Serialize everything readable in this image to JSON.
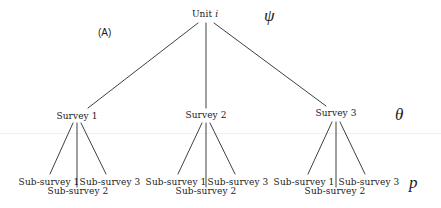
{
  "diagram": {
    "panel_label": "(A)",
    "root": {
      "label_prefix": "Unit ",
      "label_var": "i"
    },
    "levels": {
      "psi": "ψ",
      "theta": "θ",
      "p": "p"
    },
    "surveys": [
      {
        "label": "Survey 1",
        "subsurveys": [
          "Sub-survey 1",
          "Sub-survey 2",
          "Sub-survey 3"
        ]
      },
      {
        "label": "Survey 2",
        "subsurveys": [
          "Sub-survey 1",
          "Sub-survey 2",
          "Sub-survey 3"
        ]
      },
      {
        "label": "Survey 3",
        "subsurveys": [
          "Sub-survey 1",
          "Sub-survey 2",
          "Sub-survey 3"
        ]
      }
    ],
    "colors": {
      "line": "#2a2a2a",
      "text": "#1a1a1a",
      "background": "#ffffff"
    }
  }
}
